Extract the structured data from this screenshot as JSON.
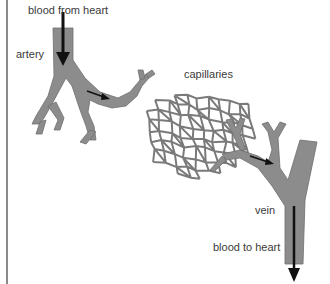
{
  "diagram": {
    "labels": {
      "blood_from_heart": "blood from heart",
      "artery": "artery",
      "capillaries": "capillaries",
      "vein": "vein",
      "blood_to_heart": "blood to heart"
    },
    "colors": {
      "vessel": "#8c8c8c",
      "vessel_outline": "#6e6e6e",
      "arrow": "#111111",
      "text": "#3a3a3a",
      "frame_line": "#8a8a8a"
    },
    "flow_direction": [
      "artery",
      "capillaries",
      "vein"
    ]
  }
}
